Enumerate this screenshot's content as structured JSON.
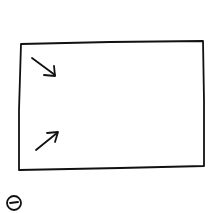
{
  "sketch": {
    "description": "Hand-drawn wireframe: a rectangular frame containing two arrows, with a minus-in-circle icon below",
    "stroke_color": "#111111",
    "background": "#ffffff",
    "frame": {
      "shape": "rectangle"
    },
    "arrows": [
      {
        "direction": "down-right",
        "icon": "arrow-down-right-icon"
      },
      {
        "direction": "up-right",
        "icon": "arrow-up-right-icon"
      }
    ],
    "bottom_icon": {
      "icon": "minus-circle-icon"
    }
  }
}
